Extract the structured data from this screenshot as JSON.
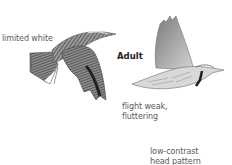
{
  "figure": {
    "title_label": "Adult",
    "annotations": {
      "tail": "limited white",
      "flight_line1": "flight weak,",
      "flight_line2": "fluttering",
      "head_line1": "low-contrast",
      "head_line2": "head pattern"
    },
    "birds": [
      {
        "name": "bird-upperside-flight",
        "view": "dorsal"
      },
      {
        "name": "bird-underside-flight",
        "view": "ventral"
      }
    ],
    "colors": {
      "background": "#ffffff",
      "text": "#5a5a5a",
      "bird_dark": "#3a3a3a",
      "bird_light": "#c8c8c8"
    }
  }
}
